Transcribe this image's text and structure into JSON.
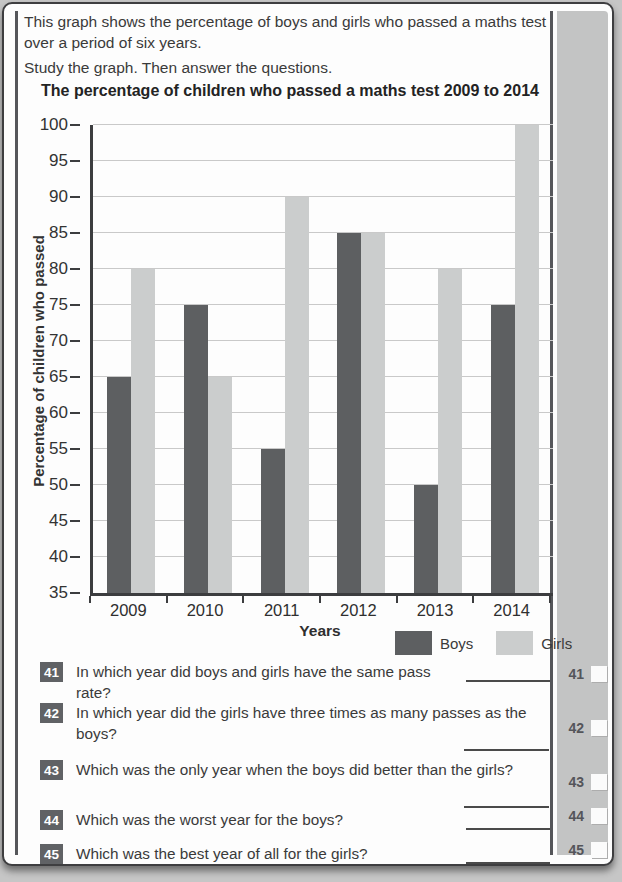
{
  "page": {
    "intro_line1": "This graph shows the percentage of boys and girls who passed a maths test over a period of six years.",
    "intro_line2": "Study the graph. Then answer the questions."
  },
  "chart_data": {
    "type": "bar",
    "title": "The percentage of children who passed a maths test 2009 to 2014",
    "categories": [
      "2009",
      "2010",
      "2011",
      "2012",
      "2013",
      "2014"
    ],
    "series": [
      {
        "name": "Boys",
        "color": "#5d5f61",
        "values": [
          65,
          75,
          55,
          85,
          50,
          75
        ]
      },
      {
        "name": "Girls",
        "color": "#cbcdcd",
        "values": [
          80,
          65,
          90,
          85,
          80,
          100
        ]
      }
    ],
    "xlabel": "Years",
    "ylabel": "Percentage of children who passed",
    "ylim": [
      35,
      100
    ],
    "ytick_step": 5,
    "grid": true,
    "legend_position": "bottom-right"
  },
  "questions": [
    {
      "number": "41",
      "text": "In which year did boys and girls have the same pass rate?"
    },
    {
      "number": "42",
      "text": "In which year did the girls have three times as many passes as the boys?"
    },
    {
      "number": "43",
      "text": "Which was the only year when the boys did better than the girls?"
    },
    {
      "number": "44",
      "text": "Which was the worst year for the boys?"
    },
    {
      "number": "45",
      "text": "Which was the best year of all for the girls?"
    }
  ],
  "margin_marks": [
    {
      "number": "41"
    },
    {
      "number": "42"
    },
    {
      "number": "43"
    },
    {
      "number": "44"
    },
    {
      "number": "45"
    }
  ],
  "colors": {
    "badge_bg": "#606265",
    "sidebar_bg": "#c3c4c4",
    "boys_bar": "#5d5f61",
    "girls_bar": "#cbcdcd"
  }
}
